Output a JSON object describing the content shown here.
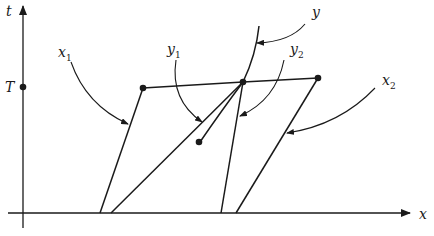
{
  "diagram": {
    "axes": {
      "vertical_label": "t",
      "horizontal_label": "x",
      "tick_label": "T"
    },
    "labels": {
      "x1": {
        "base": "x",
        "sub": "1"
      },
      "y1": {
        "base": "y",
        "sub": "1"
      },
      "y": {
        "base": "y",
        "sub": ""
      },
      "y2": {
        "base": "y",
        "sub": "2"
      },
      "x2": {
        "base": "x",
        "sub": "2"
      }
    },
    "colors": {
      "ink": "#1a1a1a",
      "background": "#ffffff"
    }
  }
}
